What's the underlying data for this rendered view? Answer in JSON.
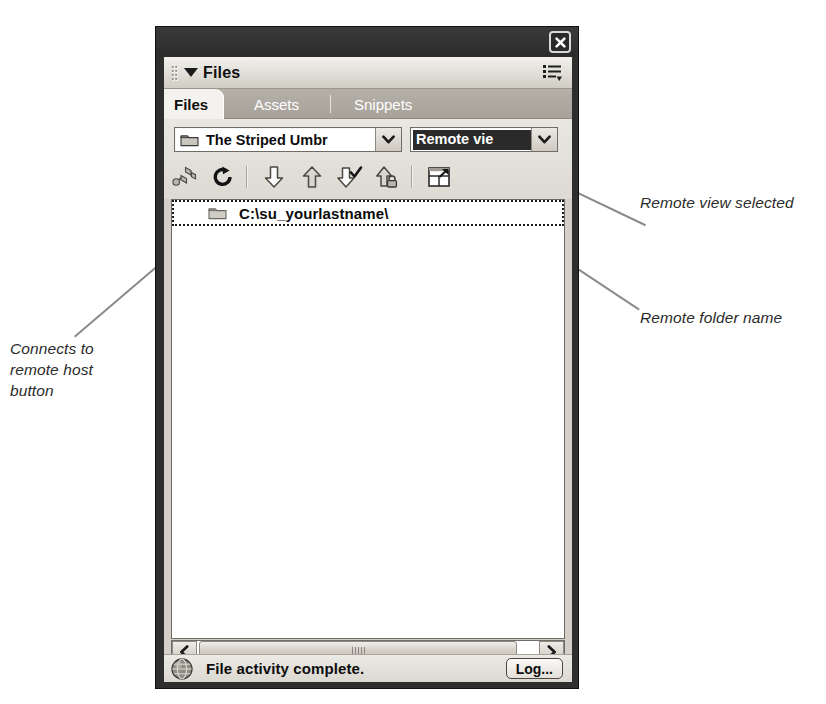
{
  "panel": {
    "title": "Files",
    "close_icon": "close-icon",
    "menu_icon": "panel-options-icon",
    "grip_icon": "drag-grip-icon",
    "collapse_icon": "collapse-triangle-icon"
  },
  "tabs": [
    {
      "label": "Files",
      "active": true
    },
    {
      "label": "Assets",
      "active": false
    },
    {
      "label": "Snippets",
      "active": false
    }
  ],
  "toolbar": {
    "site_dropdown": {
      "value": "The Striped Umbr",
      "icon": "folder-icon",
      "arrow_icon": "chevron-down-icon"
    },
    "view_dropdown": {
      "value": "Remote vie",
      "selected": true,
      "arrow_icon": "chevron-down-icon"
    },
    "buttons": [
      {
        "name": "connect-to-remote-host-button",
        "icon": "plug-connect-icon"
      },
      {
        "name": "refresh-button",
        "icon": "refresh-circular-arrow-icon"
      },
      {
        "name": "get-files-button",
        "icon": "arrow-down-icon"
      },
      {
        "name": "put-files-button",
        "icon": "arrow-up-icon"
      },
      {
        "name": "check-out-button",
        "icon": "arrow-down-check-icon"
      },
      {
        "name": "check-in-button",
        "icon": "arrow-up-lock-icon"
      },
      {
        "name": "expand-collapse-button",
        "icon": "expand-panel-icon"
      }
    ]
  },
  "filelist": {
    "columns": [],
    "rows": [
      {
        "name": "C:\\su_yourlastname\\",
        "icon": "folder-icon",
        "selected": true
      }
    ]
  },
  "scrollbar": {
    "left_arrow_icon": "chevron-left-icon",
    "right_arrow_icon": "chevron-right-icon",
    "grip_icon": "scroll-grip-icon"
  },
  "statusbar": {
    "icon": "globe-icon",
    "message": "File activity complete.",
    "log_button": "Log..."
  },
  "annotations": [
    {
      "id": "connects",
      "text": "Connects to\nremote host\nbutton"
    },
    {
      "id": "remote_view",
      "text": "Remote view selected"
    },
    {
      "id": "remote_folder",
      "text": "Remote folder name"
    }
  ],
  "colors": {
    "panel_chrome": "#2e2e2e",
    "panel_face": "#d4d0c8",
    "tab_active_bg": "#f4f2ee",
    "tab_inactive_bg": "#a7a39b",
    "selection_bg": "#2a2a2a",
    "annotation_text": "#2b2b2b",
    "leader_line": "#8a8a8a"
  }
}
